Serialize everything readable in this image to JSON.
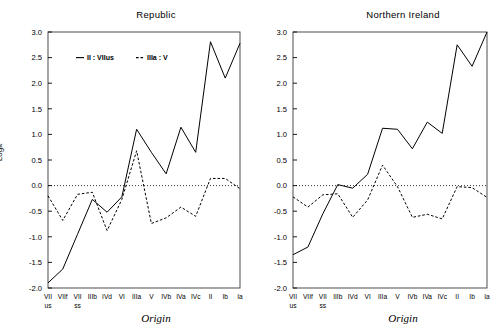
{
  "figure": {
    "background": "#ffffff",
    "foreground": "#000000",
    "width": 503,
    "height": 335
  },
  "panels": [
    {
      "key": "republic",
      "title": "Republic"
    },
    {
      "key": "northern_ireland",
      "title": "Northern Ireland"
    }
  ],
  "axes": {
    "ylabel": "Logit",
    "xlabel": "Origin",
    "yticks": [
      "3.0",
      "2.5",
      "2.0",
      "1.5",
      "1.0",
      "0.5",
      "0.0",
      "-0.5",
      "-1.0",
      "-1.5",
      "-2.0"
    ],
    "xticks_top": [
      "VII",
      "VIIf",
      "VII",
      "IIIb",
      "IVd",
      "VI",
      "IIIa",
      "V",
      "IVb",
      "IVa",
      "IVc",
      "II",
      "Ib",
      "Ia"
    ],
    "xticks_bottom": [
      "us",
      "",
      "ss",
      "",
      "",
      "",
      "",
      "",
      "",
      "",
      "",
      "",
      "",
      ""
    ]
  },
  "legend": {
    "entries": [
      {
        "label": "II : VIIus",
        "style": "solid",
        "dash_glyph": "—"
      },
      {
        "label": "IIIa : V",
        "style": "dashed",
        "dash_glyph": "--"
      }
    ]
  },
  "chart_data": {
    "type": "line",
    "xlabel": "Origin",
    "ylabel": "Logit",
    "ylim": [
      -2.0,
      3.0
    ],
    "ytick_step": 0.5,
    "grid": false,
    "zero_reference_line": {
      "value": 0.0,
      "style": "dotted"
    },
    "legend_position": "upper-left-inside",
    "categories": [
      "VIIus",
      "VIIf",
      "VIIss",
      "IIIb",
      "IVd",
      "VI",
      "IIIa",
      "V",
      "IVb",
      "IVa",
      "IVc",
      "II",
      "Ib",
      "Ia"
    ],
    "panels": [
      {
        "name": "Republic",
        "series": [
          {
            "name": "II : VIIus",
            "style": "solid",
            "values": [
              -1.9,
              -1.63,
              -0.95,
              -0.27,
              -0.52,
              -0.22,
              1.1,
              0.65,
              0.23,
              1.14,
              0.65,
              2.81,
              2.1,
              2.78
            ]
          },
          {
            "name": "IIIa : V",
            "style": "dashed",
            "values": [
              -0.2,
              -0.68,
              -0.17,
              -0.13,
              -0.88,
              -0.27,
              0.68,
              -0.74,
              -0.63,
              -0.42,
              -0.6,
              0.14,
              0.14,
              -0.06
            ]
          }
        ]
      },
      {
        "name": "Northern Ireland",
        "series": [
          {
            "name": "II : VIIus",
            "style": "solid",
            "values": [
              -1.35,
              -1.2,
              -0.55,
              0.02,
              -0.05,
              0.22,
              1.12,
              1.1,
              0.72,
              1.24,
              1.02,
              2.75,
              2.33,
              3.0
            ]
          },
          {
            "name": "IIIa : V",
            "style": "dashed",
            "values": [
              -0.22,
              -0.42,
              -0.18,
              -0.16,
              -0.62,
              -0.28,
              0.4,
              -0.02,
              -0.62,
              -0.56,
              -0.65,
              -0.02,
              -0.04,
              -0.23
            ]
          }
        ]
      }
    ]
  }
}
